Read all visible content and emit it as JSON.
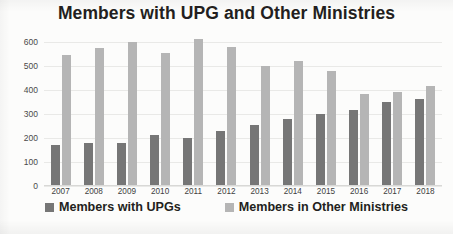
{
  "chart_data": {
    "type": "bar",
    "title": "Members with UPG and Other Ministries",
    "xlabel": "",
    "ylabel": "",
    "ylim": [
      0,
      600
    ],
    "yticks": [
      0,
      100,
      200,
      300,
      400,
      500,
      600
    ],
    "grid": true,
    "legend_position": "bottom",
    "categories": [
      "2007",
      "2008",
      "2009",
      "2010",
      "2011",
      "2012",
      "2013",
      "2014",
      "2015",
      "2016",
      "2017",
      "2018"
    ],
    "series": [
      {
        "name": "Members with UPGs",
        "color": "#767676",
        "values": [
          170,
          178,
          180,
          214,
          202,
          230,
          255,
          280,
          298,
          315,
          348,
          362
        ]
      },
      {
        "name": "Members in Other Ministries",
        "color": "#b5b5b5",
        "values": [
          545,
          575,
          600,
          555,
          613,
          578,
          500,
          520,
          478,
          385,
          392,
          415
        ]
      }
    ]
  },
  "legend": {
    "items": [
      {
        "label": "Members with UPGs",
        "swatch": "upg"
      },
      {
        "label": "Members in Other Ministries",
        "swatch": "other"
      }
    ]
  }
}
